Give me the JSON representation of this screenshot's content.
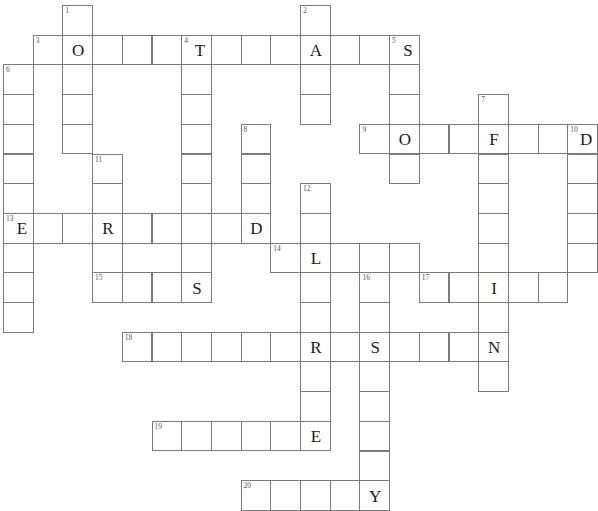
{
  "puzzle": {
    "title": "Crossword Puzzle Grid",
    "grid": {
      "columns": 20,
      "rows": 16,
      "cell_size": 29.7,
      "origin_x": 3,
      "origin_y": 5,
      "border_color": "#7b7b7b",
      "cell_fill": "#ffffff",
      "letter_color": "#1b1b1b",
      "number_color": "#555555"
    },
    "entries": [
      {
        "number": "1",
        "direction": "down",
        "row": 0,
        "col": 2,
        "length": 5
      },
      {
        "number": "2",
        "direction": "down",
        "row": 0,
        "col": 10,
        "length": 4
      },
      {
        "number": "3",
        "direction": "across",
        "row": 1,
        "col": 1,
        "length": 13
      },
      {
        "number": "4",
        "direction": "down",
        "row": 1,
        "col": 6,
        "length": 11
      },
      {
        "number": "5",
        "direction": "down",
        "row": 1,
        "col": 13,
        "length": 5
      },
      {
        "number": "6",
        "direction": "down",
        "row": 2,
        "col": 0,
        "length": 9
      },
      {
        "number": "7",
        "direction": "down",
        "row": 3,
        "col": 16,
        "length": 9
      },
      {
        "number": "8",
        "direction": "down",
        "row": 4,
        "col": 8,
        "length": 5
      },
      {
        "number": "9",
        "direction": "across",
        "row": 4,
        "col": 12,
        "length": 7
      },
      {
        "number": "10",
        "direction": "down",
        "row": 4,
        "col": 19,
        "length": 5
      },
      {
        "number": "11",
        "direction": "down",
        "row": 5,
        "col": 3,
        "length": 4
      },
      {
        "number": "12",
        "direction": "down",
        "row": 6,
        "col": 10,
        "length": 10
      },
      {
        "number": "13",
        "direction": "across",
        "row": 7,
        "col": 0,
        "length": 9
      },
      {
        "number": "14",
        "direction": "across",
        "row": 8,
        "col": 9,
        "length": 5
      },
      {
        "number": "15",
        "direction": "across",
        "row": 9,
        "col": 3,
        "length": 4
      },
      {
        "number": "16",
        "direction": "down",
        "row": 9,
        "col": 12,
        "length": 7
      },
      {
        "number": "17",
        "direction": "across",
        "row": 9,
        "col": 14,
        "length": 5
      },
      {
        "number": "18",
        "direction": "across",
        "row": 11,
        "col": 4,
        "length": 13
      },
      {
        "number": "19",
        "direction": "across",
        "row": 14,
        "col": 5,
        "length": 6
      },
      {
        "number": "20",
        "direction": "across",
        "row": 16,
        "col": 8,
        "length": 5
      }
    ],
    "cells": [
      {
        "row": 0,
        "col": 2,
        "number": "1",
        "letter": ""
      },
      {
        "row": 0,
        "col": 10,
        "number": "2",
        "letter": ""
      },
      {
        "row": 1,
        "col": 1,
        "number": "3",
        "letter": ""
      },
      {
        "row": 1,
        "col": 2,
        "number": "",
        "letter": "O"
      },
      {
        "row": 1,
        "col": 3,
        "number": "",
        "letter": ""
      },
      {
        "row": 1,
        "col": 4,
        "number": "",
        "letter": ""
      },
      {
        "row": 1,
        "col": 5,
        "number": "",
        "letter": ""
      },
      {
        "row": 1,
        "col": 6,
        "number": "4",
        "letter": "T"
      },
      {
        "row": 1,
        "col": 7,
        "number": "",
        "letter": ""
      },
      {
        "row": 1,
        "col": 8,
        "number": "",
        "letter": ""
      },
      {
        "row": 1,
        "col": 9,
        "number": "",
        "letter": ""
      },
      {
        "row": 1,
        "col": 10,
        "number": "",
        "letter": "A"
      },
      {
        "row": 1,
        "col": 11,
        "number": "",
        "letter": ""
      },
      {
        "row": 1,
        "col": 12,
        "number": "",
        "letter": ""
      },
      {
        "row": 1,
        "col": 13,
        "number": "5",
        "letter": "S"
      },
      {
        "row": 2,
        "col": 0,
        "number": "6",
        "letter": ""
      },
      {
        "row": 2,
        "col": 2,
        "number": "",
        "letter": ""
      },
      {
        "row": 2,
        "col": 6,
        "number": "",
        "letter": ""
      },
      {
        "row": 2,
        "col": 10,
        "number": "",
        "letter": ""
      },
      {
        "row": 2,
        "col": 13,
        "number": "",
        "letter": ""
      },
      {
        "row": 3,
        "col": 0,
        "number": "",
        "letter": ""
      },
      {
        "row": 3,
        "col": 2,
        "number": "",
        "letter": ""
      },
      {
        "row": 3,
        "col": 6,
        "number": "",
        "letter": ""
      },
      {
        "row": 3,
        "col": 10,
        "number": "",
        "letter": ""
      },
      {
        "row": 3,
        "col": 13,
        "number": "",
        "letter": ""
      },
      {
        "row": 3,
        "col": 16,
        "number": "7",
        "letter": ""
      },
      {
        "row": 4,
        "col": 0,
        "number": "",
        "letter": ""
      },
      {
        "row": 4,
        "col": 2,
        "number": "",
        "letter": ""
      },
      {
        "row": 4,
        "col": 6,
        "number": "",
        "letter": ""
      },
      {
        "row": 4,
        "col": 8,
        "number": "8",
        "letter": ""
      },
      {
        "row": 4,
        "col": 12,
        "number": "9",
        "letter": ""
      },
      {
        "row": 4,
        "col": 13,
        "number": "",
        "letter": "O"
      },
      {
        "row": 4,
        "col": 14,
        "number": "",
        "letter": ""
      },
      {
        "row": 4,
        "col": 15,
        "number": "",
        "letter": ""
      },
      {
        "row": 4,
        "col": 16,
        "number": "",
        "letter": "F"
      },
      {
        "row": 4,
        "col": 17,
        "number": "",
        "letter": ""
      },
      {
        "row": 4,
        "col": 18,
        "number": "",
        "letter": ""
      },
      {
        "row": 4,
        "col": 19,
        "number": "10",
        "letter": "D"
      },
      {
        "row": 5,
        "col": 0,
        "number": "",
        "letter": ""
      },
      {
        "row": 5,
        "col": 3,
        "number": "11",
        "letter": ""
      },
      {
        "row": 5,
        "col": 6,
        "number": "",
        "letter": ""
      },
      {
        "row": 5,
        "col": 8,
        "number": "",
        "letter": ""
      },
      {
        "row": 5,
        "col": 13,
        "number": "",
        "letter": ""
      },
      {
        "row": 5,
        "col": 16,
        "number": "",
        "letter": ""
      },
      {
        "row": 5,
        "col": 19,
        "number": "",
        "letter": ""
      },
      {
        "row": 6,
        "col": 0,
        "number": "",
        "letter": ""
      },
      {
        "row": 6,
        "col": 3,
        "number": "",
        "letter": ""
      },
      {
        "row": 6,
        "col": 6,
        "number": "",
        "letter": ""
      },
      {
        "row": 6,
        "col": 8,
        "number": "",
        "letter": ""
      },
      {
        "row": 6,
        "col": 10,
        "number": "12",
        "letter": ""
      },
      {
        "row": 6,
        "col": 16,
        "number": "",
        "letter": ""
      },
      {
        "row": 6,
        "col": 19,
        "number": "",
        "letter": ""
      },
      {
        "row": 7,
        "col": 0,
        "number": "13",
        "letter": "E"
      },
      {
        "row": 7,
        "col": 1,
        "number": "",
        "letter": ""
      },
      {
        "row": 7,
        "col": 2,
        "number": "",
        "letter": ""
      },
      {
        "row": 7,
        "col": 3,
        "number": "",
        "letter": "R"
      },
      {
        "row": 7,
        "col": 4,
        "number": "",
        "letter": ""
      },
      {
        "row": 7,
        "col": 5,
        "number": "",
        "letter": ""
      },
      {
        "row": 7,
        "col": 6,
        "number": "",
        "letter": ""
      },
      {
        "row": 7,
        "col": 7,
        "number": "",
        "letter": ""
      },
      {
        "row": 7,
        "col": 8,
        "number": "",
        "letter": "D"
      },
      {
        "row": 7,
        "col": 10,
        "number": "",
        "letter": ""
      },
      {
        "row": 7,
        "col": 16,
        "number": "",
        "letter": ""
      },
      {
        "row": 7,
        "col": 19,
        "number": "",
        "letter": ""
      },
      {
        "row": 8,
        "col": 0,
        "number": "",
        "letter": ""
      },
      {
        "row": 8,
        "col": 3,
        "number": "",
        "letter": ""
      },
      {
        "row": 8,
        "col": 6,
        "number": "",
        "letter": ""
      },
      {
        "row": 8,
        "col": 9,
        "number": "14",
        "letter": ""
      },
      {
        "row": 8,
        "col": 10,
        "number": "",
        "letter": "L"
      },
      {
        "row": 8,
        "col": 11,
        "number": "",
        "letter": ""
      },
      {
        "row": 8,
        "col": 12,
        "number": "",
        "letter": ""
      },
      {
        "row": 8,
        "col": 13,
        "number": "",
        "letter": ""
      },
      {
        "row": 8,
        "col": 16,
        "number": "",
        "letter": ""
      },
      {
        "row": 8,
        "col": 19,
        "number": "",
        "letter": ""
      },
      {
        "row": 9,
        "col": 0,
        "number": "",
        "letter": ""
      },
      {
        "row": 9,
        "col": 3,
        "number": "15",
        "letter": ""
      },
      {
        "row": 9,
        "col": 4,
        "number": "",
        "letter": ""
      },
      {
        "row": 9,
        "col": 5,
        "number": "",
        "letter": ""
      },
      {
        "row": 9,
        "col": 6,
        "number": "",
        "letter": "S"
      },
      {
        "row": 9,
        "col": 10,
        "number": "",
        "letter": ""
      },
      {
        "row": 9,
        "col": 12,
        "number": "16",
        "letter": ""
      },
      {
        "row": 9,
        "col": 14,
        "number": "17",
        "letter": ""
      },
      {
        "row": 9,
        "col": 15,
        "number": "",
        "letter": ""
      },
      {
        "row": 9,
        "col": 16,
        "number": "",
        "letter": "I"
      },
      {
        "row": 9,
        "col": 17,
        "number": "",
        "letter": ""
      },
      {
        "row": 9,
        "col": 18,
        "number": "",
        "letter": ""
      },
      {
        "row": 10,
        "col": 0,
        "number": "",
        "letter": ""
      },
      {
        "row": 10,
        "col": 10,
        "number": "",
        "letter": ""
      },
      {
        "row": 10,
        "col": 12,
        "number": "",
        "letter": ""
      },
      {
        "row": 10,
        "col": 16,
        "number": "",
        "letter": ""
      },
      {
        "row": 11,
        "col": 4,
        "number": "18",
        "letter": ""
      },
      {
        "row": 11,
        "col": 5,
        "number": "",
        "letter": ""
      },
      {
        "row": 11,
        "col": 6,
        "number": "",
        "letter": ""
      },
      {
        "row": 11,
        "col": 7,
        "number": "",
        "letter": ""
      },
      {
        "row": 11,
        "col": 8,
        "number": "",
        "letter": ""
      },
      {
        "row": 11,
        "col": 9,
        "number": "",
        "letter": ""
      },
      {
        "row": 11,
        "col": 10,
        "number": "",
        "letter": "R"
      },
      {
        "row": 11,
        "col": 11,
        "number": "",
        "letter": ""
      },
      {
        "row": 11,
        "col": 12,
        "number": "",
        "letter": "S"
      },
      {
        "row": 11,
        "col": 13,
        "number": "",
        "letter": ""
      },
      {
        "row": 11,
        "col": 14,
        "number": "",
        "letter": ""
      },
      {
        "row": 11,
        "col": 15,
        "number": "",
        "letter": ""
      },
      {
        "row": 11,
        "col": 16,
        "number": "",
        "letter": "N"
      },
      {
        "row": 12,
        "col": 10,
        "number": "",
        "letter": ""
      },
      {
        "row": 12,
        "col": 12,
        "number": "",
        "letter": ""
      },
      {
        "row": 12,
        "col": 16,
        "number": "",
        "letter": ""
      },
      {
        "row": 13,
        "col": 10,
        "number": "",
        "letter": ""
      },
      {
        "row": 13,
        "col": 12,
        "number": "",
        "letter": ""
      },
      {
        "row": 14,
        "col": 5,
        "number": "19",
        "letter": ""
      },
      {
        "row": 14,
        "col": 6,
        "number": "",
        "letter": ""
      },
      {
        "row": 14,
        "col": 7,
        "number": "",
        "letter": ""
      },
      {
        "row": 14,
        "col": 8,
        "number": "",
        "letter": ""
      },
      {
        "row": 14,
        "col": 9,
        "number": "",
        "letter": ""
      },
      {
        "row": 14,
        "col": 10,
        "number": "",
        "letter": "E"
      },
      {
        "row": 14,
        "col": 12,
        "number": "",
        "letter": ""
      },
      {
        "row": 15,
        "col": 12,
        "number": "",
        "letter": ""
      },
      {
        "row": 16,
        "col": 8,
        "number": "20",
        "letter": ""
      },
      {
        "row": 16,
        "col": 9,
        "number": "",
        "letter": ""
      },
      {
        "row": 16,
        "col": 10,
        "number": "",
        "letter": ""
      },
      {
        "row": 16,
        "col": 11,
        "number": "",
        "letter": ""
      },
      {
        "row": 16,
        "col": 12,
        "number": "",
        "letter": "Y"
      }
    ]
  }
}
